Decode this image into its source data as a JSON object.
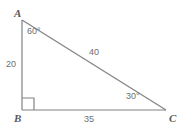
{
  "figure": {
    "type": "right-triangle-diagram",
    "background_color": "#ffffff",
    "stroke_color": "#808285",
    "label_color": "#6d6e71",
    "vertex_label_color": "#58595b",
    "vertices": {
      "A": {
        "label": "A",
        "x": 22,
        "y": 20
      },
      "B": {
        "label": "B",
        "x": 22,
        "y": 110
      },
      "C": {
        "label": "C",
        "x": 166,
        "y": 110
      }
    },
    "angles": [
      {
        "at": "A",
        "label": "60°"
      },
      {
        "at": "B",
        "label": "right-angle-marker"
      },
      {
        "at": "C",
        "label": "30°"
      }
    ],
    "sides": [
      {
        "name": "AB",
        "label": "20"
      },
      {
        "name": "BC",
        "label": "35"
      },
      {
        "name": "AC",
        "label": "40"
      }
    ]
  }
}
